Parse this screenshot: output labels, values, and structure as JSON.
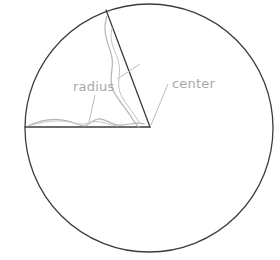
{
  "figure": {
    "kind": "geometry-diagram",
    "background_color": "#ffffff",
    "width": 280,
    "height": 260
  },
  "style": {
    "outline_color": "#3c3c3c",
    "outline_width": 1.3,
    "sketch_color": "#b4b4b4",
    "sketch_width": 1.2,
    "leader_color": "#bdbdbd",
    "leader_width": 1.0,
    "label_color": "#a8a8a8",
    "label_size": 13
  },
  "circle": {
    "center_x": 149,
    "center_y": 128,
    "radius": 124
  },
  "sector": {
    "apex_x": 150,
    "apex_y": 127,
    "arm_left_x": 25,
    "arm_left_y": 127,
    "arm_up_x": 106,
    "arm_up_y": 10,
    "fill": "none"
  },
  "labels": {
    "radius": {
      "text": "radius",
      "x": 73,
      "y": 91
    },
    "center": {
      "text": "center",
      "x": 172,
      "y": 88
    }
  },
  "leaders": {
    "radius_upper": "M 117 79 L 140 64",
    "radius_lower": "M 95 95 L 89 122",
    "center_line": "M 168 84 L 151 125"
  },
  "sketch_paths": {
    "arm_up_inner": "M 107 16 C 101 34, 110 45, 112 58 C 114 70, 108 78, 113 90 C 118 101, 128 110, 133 120 C 136 125, 138 126, 139 127",
    "arm_up_inner2": "M 112 28 C 108 44, 117 52, 119 64 C 121 76, 116 84, 121 95 C 126 105, 134 113, 139 122",
    "arm_left_inner": "M 28 126 C 42 119, 56 118, 68 121 C 76 123, 80 126, 84 126 C 88 126, 92 120, 98 119 C 104 118, 110 124, 118 125 C 128 126, 136 121, 144 124",
    "arm_left_inner2": "M 32 125 C 48 120, 62 120, 74 123 C 82 125, 86 124, 92 122 C 100 120, 108 125, 118 126"
  }
}
